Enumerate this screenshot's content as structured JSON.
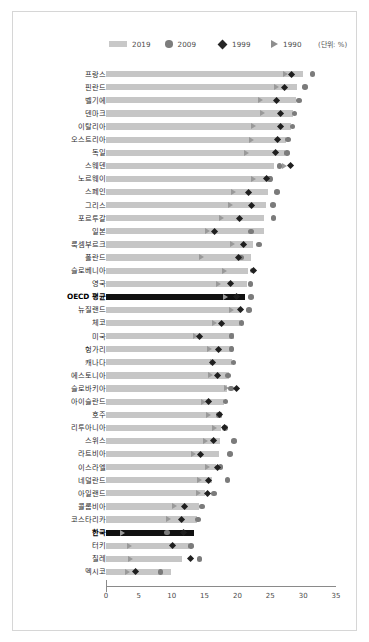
{
  "legend": {
    "items": [
      {
        "label": "2019",
        "icon": "bar-swatch-icon",
        "color": "#c8c8c8"
      },
      {
        "label": "2009",
        "icon": "circle-marker-icon",
        "color": "#7d7d7d"
      },
      {
        "label": "1999",
        "icon": "diamond-marker-icon",
        "color": "#262626"
      },
      {
        "label": "1990",
        "icon": "triangle-marker-icon",
        "color": "#8e8e8e"
      }
    ],
    "unit_note": "(단위: %)"
  },
  "chart_data": {
    "type": "bar",
    "orientation": "horizontal",
    "title": "",
    "xlabel": "",
    "ylabel": "",
    "xlim": [
      0,
      35
    ],
    "xticks": [
      0,
      5,
      10,
      15,
      20,
      25,
      30,
      35
    ],
    "grid": false,
    "legend_position": "top",
    "unit": "%",
    "categories": [
      "프랑스",
      "핀란드",
      "벨기에",
      "덴마크",
      "이탈리아",
      "오스트리아",
      "독일",
      "스웨덴",
      "노르웨이",
      "스페인",
      "그리스",
      "포르투갈",
      "일본",
      "룩셈부르크",
      "폴란드",
      "슬로베니아",
      "영국",
      "OECD 평균",
      "뉴질랜드",
      "체코",
      "미국",
      "헝가리",
      "캐나다",
      "에스토니아",
      "슬로바키아",
      "아이슬란드",
      "호주",
      "리투아니아",
      "스위스",
      "라트비아",
      "이스라엘",
      "네덜란드",
      "아일랜드",
      "콜롬비아",
      "코스타리카",
      "한국",
      "터키",
      "칠레",
      "멕시코"
    ],
    "highlighted_categories": [
      "OECD 평균",
      "한국"
    ],
    "series": [
      {
        "name": "2019",
        "marker": "bar",
        "values": [
          30.0,
          29.1,
          28.9,
          28.4,
          28.2,
          27.4,
          27.3,
          25.5,
          25.3,
          24.7,
          24.4,
          24.1,
          24.0,
          22.4,
          22.0,
          21.6,
          21.5,
          21.2,
          20.5,
          20.4,
          19.5,
          19.3,
          19.2,
          18.7,
          18.4,
          18.0,
          17.6,
          17.5,
          17.4,
          17.2,
          16.8,
          16.1,
          15.1,
          14.2,
          13.8,
          13.4,
          12.6,
          11.6,
          9.9
        ]
      },
      {
        "name": "2009",
        "marker": "circle",
        "values": [
          31.4,
          30.3,
          29.4,
          28.7,
          28.4,
          27.7,
          27.5,
          26.4,
          25.0,
          26.0,
          25.4,
          25.5,
          22.1,
          23.3,
          20.5,
          22.3,
          22.0,
          22.1,
          21.8,
          20.6,
          19.1,
          19.1,
          19.4,
          18.6,
          19.0,
          18.2,
          17.2,
          18.1,
          19.5,
          18.9,
          17.4,
          18.5,
          16.4,
          14.6,
          14.0,
          9.3,
          12.9,
          14.2,
          8.3
        ]
      },
      {
        "name": "1999",
        "marker": "diamond",
        "values": [
          28.3,
          27.2,
          25.9,
          26.5,
          26.6,
          26.1,
          25.8,
          28.1,
          24.4,
          21.7,
          22.1,
          20.3,
          16.5,
          21.0,
          20.2,
          22.4,
          19.0,
          19.9,
          20.5,
          17.6,
          14.2,
          17.1,
          16.2,
          16.9,
          19.8,
          15.6,
          17.3,
          18.1,
          16.4,
          14.4,
          17.0,
          15.6,
          15.5,
          12.0,
          11.5,
          11.8,
          10.2,
          12.9,
          4.5
        ]
      },
      {
        "name": "1990",
        "marker": "triangle",
        "values": [
          27.4,
          26.0,
          23.5,
          23.9,
          22.5,
          22.1,
          21.4,
          27.2,
          22.4,
          19.4,
          18.9,
          17.6,
          15.4,
          19.3,
          14.6,
          18.0,
          17.2,
          18.2,
          19.1,
          16.5,
          13.6,
          15.8,
          16.2,
          15.9,
          18.4,
          14.9,
          15.7,
          16.6,
          15.1,
          13.4,
          15.4,
          14.2,
          14.1,
          10.5,
          9.5,
          2.6,
          3.6,
          3.8,
          3.3
        ]
      }
    ]
  }
}
